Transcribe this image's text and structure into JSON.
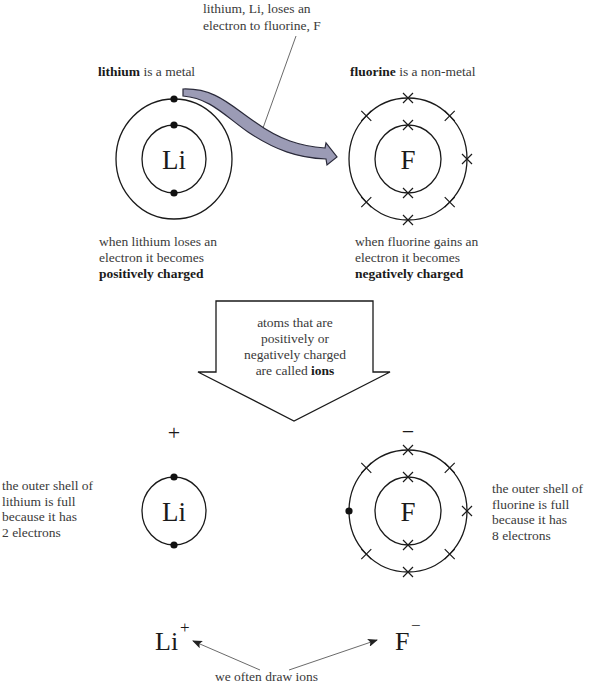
{
  "top_caption": {
    "lines": [
      "lithium, Li, loses an",
      "electron to fluorine, F"
    ]
  },
  "lithium_atom": {
    "heading_bold": "lithium",
    "heading_rest": " is a metal",
    "symbol": "Li",
    "inner_shell_electrons": 2,
    "outer_shell_electrons": 1,
    "electron_marker": "dot",
    "caption_lines": [
      "when lithium loses an",
      "electron it becomes"
    ],
    "caption_bold": "positively charged"
  },
  "fluorine_atom": {
    "heading_bold": "fluorine",
    "heading_rest": " is a non-metal",
    "symbol": "F",
    "inner_shell_electrons": 2,
    "outer_shell_electrons": 7,
    "electron_marker": "cross",
    "caption_lines": [
      "when fluorine gains an",
      "electron it becomes"
    ],
    "caption_bold": "negatively charged"
  },
  "transfer_arrow": {
    "fill_color": "#9b9bb5",
    "stroke_color": "#2a2a3a"
  },
  "big_arrow": {
    "lines": [
      "atoms that are",
      "positively or",
      "negatively charged"
    ],
    "last_line_text": "are called ",
    "last_line_bold": "ions"
  },
  "lithium_ion": {
    "charge": "+",
    "symbol": "Li",
    "shell_electrons": 2,
    "note_lines": [
      "the outer shell of",
      "lithium is full",
      "because it has",
      "2 electrons"
    ]
  },
  "fluorine_ion": {
    "charge": "−",
    "symbol": "F",
    "inner_shell_electrons": 2,
    "outer_shell_crosses": 7,
    "outer_shell_dots": 1,
    "note_lines": [
      "the outer shell of",
      "fluorine is full",
      "because it has",
      "8 electrons"
    ]
  },
  "formulas": {
    "li_symbol": "Li",
    "li_charge": "+",
    "f_symbol": "F",
    "f_charge": "−",
    "caption": "we often draw ions"
  }
}
